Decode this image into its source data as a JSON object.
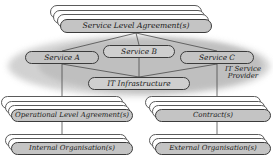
{
  "diagram": {
    "colors": {
      "node_fill": "#c4c4c4",
      "node_fill_light": "#cfcfcf",
      "node_stroke": "#3b3b3b",
      "ghost_fill": "#ffffff",
      "ghost_stroke": "#5a5a5a",
      "scope_fill": "#c9c9c9",
      "line": "#4a4a4a",
      "text": "#1a1a1a",
      "background": "#ffffff"
    },
    "nodes": {
      "sla": {
        "label": "Service Level Agreement(s)",
        "x": 60,
        "y": 19,
        "w": 152,
        "h": 14,
        "font_size": 7.6,
        "stack": 3,
        "stack_dx": -3.4,
        "stack_dy": -4.6
      },
      "service_a": {
        "label": "Service A",
        "x": 25,
        "y": 51,
        "w": 74,
        "h": 13,
        "font_size": 7.4,
        "stack": 0
      },
      "service_b": {
        "label": "Service B",
        "x": 103,
        "y": 45,
        "w": 72,
        "h": 13,
        "font_size": 7.4,
        "stack": 0
      },
      "service_c": {
        "label": "Service C",
        "x": 180,
        "y": 51,
        "w": 74,
        "h": 13,
        "font_size": 7.4,
        "stack": 0
      },
      "it_infrastructure": {
        "label": "IT Infrastructure",
        "x": 88,
        "y": 77,
        "w": 102,
        "h": 13,
        "font_size": 7.4,
        "stack": 0
      },
      "ola": {
        "label": "Operational Level Agreement(s)",
        "x": 11,
        "y": 109,
        "w": 122,
        "h": 13,
        "font_size": 7.0,
        "stack": 3,
        "stack_dx": -3.2,
        "stack_dy": -4.2
      },
      "contracts": {
        "label": "Contract(s)",
        "x": 155,
        "y": 109,
        "w": 116,
        "h": 13,
        "font_size": 7.0,
        "stack": 3,
        "stack_dx": -3.2,
        "stack_dy": -4.2
      },
      "internal_org": {
        "label": "Internal Organisation(s)",
        "x": 11,
        "y": 142,
        "w": 122,
        "h": 13,
        "font_size": 7.0,
        "stack": 2,
        "stack_dx": -3.2,
        "stack_dy": -4.2
      },
      "external_org": {
        "label": "External Organisation(s)",
        "x": 155,
        "y": 142,
        "w": 116,
        "h": 13,
        "font_size": 7.0,
        "stack": 2,
        "stack_dx": -3.2,
        "stack_dy": -4.2
      }
    },
    "captions": {
      "it_service_provider": {
        "label": "IT Service\nProvider",
        "x": 219,
        "y": 66,
        "w": 48,
        "font_size": 7.0
      }
    },
    "scope": {
      "label": "IT Service Provider scope ellipse",
      "outer": {
        "x": 8,
        "y": 36,
        "w": 262,
        "h": 60
      },
      "inner": {
        "x": 38,
        "y": 38,
        "w": 224,
        "h": 54
      }
    },
    "connections": [
      {
        "from": "sla",
        "to": "service_a",
        "kind": "fan"
      },
      {
        "from": "sla",
        "to": "service_b",
        "kind": "fan"
      },
      {
        "from": "sla",
        "to": "service_c",
        "kind": "fan"
      },
      {
        "from": "service_a",
        "to": "it_infrastructure",
        "kind": "fan"
      },
      {
        "from": "service_b",
        "to": "it_infrastructure",
        "kind": "fan"
      },
      {
        "from": "service_c",
        "to": "it_infrastructure",
        "kind": "fan"
      },
      {
        "from": "service_a",
        "to": "ola",
        "kind": "vertical"
      },
      {
        "from": "service_c",
        "to": "contracts",
        "kind": "vertical"
      },
      {
        "from": "ola",
        "to": "internal_org",
        "kind": "vertical"
      },
      {
        "from": "contracts",
        "to": "external_org",
        "kind": "vertical"
      }
    ]
  }
}
